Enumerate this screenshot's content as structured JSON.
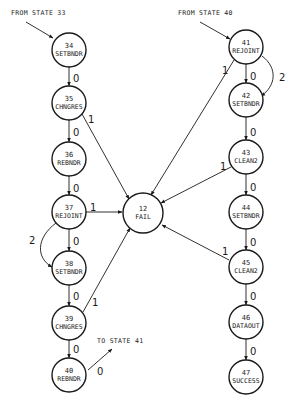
{
  "diagram": {
    "type": "state-transition-diagram",
    "external": {
      "from_state_33": "FROM STATE 33",
      "from_state_40": "FROM STATE 40",
      "to_state_41": "TO STATE 41"
    },
    "nodes": [
      {
        "id": "34",
        "name": "SETBNDR",
        "cx": 69,
        "cy": 50
      },
      {
        "id": "35",
        "name": "CHNGRES",
        "cx": 69,
        "cy": 103
      },
      {
        "id": "36",
        "name": "REBNDR",
        "cx": 69,
        "cy": 159
      },
      {
        "id": "37",
        "name": "REJOINT",
        "cx": 69,
        "cy": 212
      },
      {
        "id": "38",
        "name": "SETBNDR",
        "cx": 69,
        "cy": 268
      },
      {
        "id": "39",
        "name": "CHNGRES",
        "cx": 69,
        "cy": 323
      },
      {
        "id": "40",
        "name": "REBNDR",
        "cx": 69,
        "cy": 375
      },
      {
        "id": "12",
        "name": "FAIL",
        "cx": 143,
        "cy": 213
      },
      {
        "id": "41",
        "name": "REJOINT",
        "cx": 246,
        "cy": 47
      },
      {
        "id": "42",
        "name": "SETBNDR",
        "cx": 246,
        "cy": 100
      },
      {
        "id": "43",
        "name": "CLEAN2",
        "cx": 246,
        "cy": 157
      },
      {
        "id": "44",
        "name": "SETBNDR",
        "cx": 246,
        "cy": 212
      },
      {
        "id": "45",
        "name": "CLEAN2",
        "cx": 246,
        "cy": 267
      },
      {
        "id": "46",
        "name": "DATAOUT",
        "cx": 246,
        "cy": 322
      },
      {
        "id": "47",
        "name": "SUCCESS",
        "cx": 246,
        "cy": 377
      }
    ],
    "edges": [
      {
        "from": "33",
        "to": "34",
        "label": ""
      },
      {
        "from": "34",
        "to": "35",
        "label": "0"
      },
      {
        "from": "35",
        "to": "36",
        "label": "0"
      },
      {
        "from": "35",
        "to": "12",
        "label": "1"
      },
      {
        "from": "36",
        "to": "37",
        "label": "0"
      },
      {
        "from": "37",
        "to": "38",
        "label": "0"
      },
      {
        "from": "37",
        "to": "38",
        "label": "2"
      },
      {
        "from": "37",
        "to": "12",
        "label": "1"
      },
      {
        "from": "38",
        "to": "39",
        "label": "0"
      },
      {
        "from": "39",
        "to": "40",
        "label": "0"
      },
      {
        "from": "39",
        "to": "12",
        "label": "1"
      },
      {
        "from": "40",
        "to": "41",
        "label": "0"
      },
      {
        "from": "40",
        "to": "41-ext",
        "label": "0"
      },
      {
        "from": "40-ext",
        "to": "41",
        "label": ""
      },
      {
        "from": "41",
        "to": "42",
        "label": "0"
      },
      {
        "from": "41",
        "to": "42",
        "label": "2"
      },
      {
        "from": "41",
        "to": "12",
        "label": "1"
      },
      {
        "from": "42",
        "to": "43",
        "label": "0"
      },
      {
        "from": "43",
        "to": "44",
        "label": "0"
      },
      {
        "from": "43",
        "to": "12",
        "label": "1"
      },
      {
        "from": "44",
        "to": "45",
        "label": "0"
      },
      {
        "from": "45",
        "to": "46",
        "label": "0"
      },
      {
        "from": "45",
        "to": "12",
        "label": "1"
      },
      {
        "from": "46",
        "to": "47",
        "label": "0"
      }
    ],
    "labels": {
      "zero": "0",
      "one": "1",
      "two": "2"
    }
  }
}
